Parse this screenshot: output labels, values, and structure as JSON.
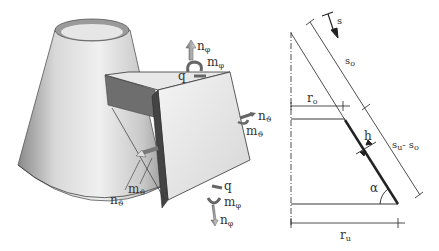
{
  "figure": {
    "left_panel": {
      "title": "Shell element on cone",
      "labels": {
        "n_phi_top": {
          "base": "n",
          "sub": "φ"
        },
        "m_phi_top": {
          "base": "m",
          "sub": "φ"
        },
        "q_top": {
          "base": "q",
          "sub": ""
        },
        "n_theta_right": {
          "base": "n",
          "sub": "ϑ"
        },
        "m_theta_right": {
          "base": "m",
          "sub": "ϑ"
        },
        "q_bottom": {
          "base": "q",
          "sub": ""
        },
        "m_phi_bottom": {
          "base": "m",
          "sub": "φ"
        },
        "n_phi_bottom": {
          "base": "n",
          "sub": "φ"
        },
        "m_theta_left": {
          "base": "m",
          "sub": "ϑ"
        },
        "n_theta_left": {
          "base": "n",
          "sub": "ϑ"
        }
      }
    },
    "right_panel": {
      "title": "Meridian section",
      "labels": {
        "s": {
          "base": "s",
          "sub": ""
        },
        "s_o": {
          "base": "s",
          "sub": "o"
        },
        "r_o": {
          "base": "r",
          "sub": "o"
        },
        "h": {
          "base": "h",
          "sub": ""
        },
        "su_minus_so": {
          "base": "s",
          "sub": "u",
          "rest": "- s",
          "sub2": "o"
        },
        "alpha": {
          "base": "α",
          "sub": ""
        },
        "r_u": {
          "base": "r",
          "sub": "u"
        }
      }
    }
  }
}
